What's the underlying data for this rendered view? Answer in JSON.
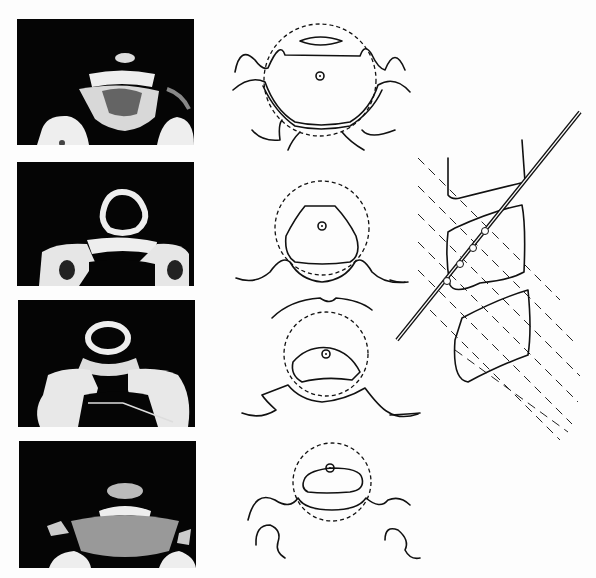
{
  "figure": {
    "panels": [
      {
        "id": "level-1",
        "ct_label": "ct-slice-1",
        "drawing_label": "schematic-1"
      },
      {
        "id": "level-2",
        "ct_label": "ct-slice-2",
        "drawing_label": "schematic-2"
      },
      {
        "id": "level-3",
        "ct_label": "ct-slice-3",
        "drawing_label": "schematic-3"
      },
      {
        "id": "level-4",
        "ct_label": "ct-slice-4",
        "drawing_label": "schematic-4"
      }
    ],
    "sagittal": {
      "scan_plane_count": 9,
      "needle_marker_count": 4
    },
    "colors": {
      "background": "#fdfdfd",
      "ct_background": "#050505",
      "bone": "#e8e8e8",
      "ink": "#111111"
    }
  }
}
